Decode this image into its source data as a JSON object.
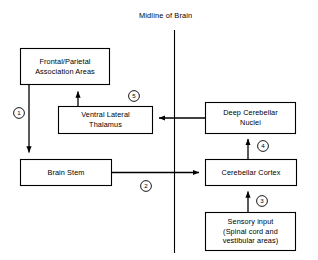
{
  "diagram": {
    "title": "Midline of Brain",
    "midline_label": "Midline of Brain",
    "nodes": [
      {
        "id": "frontal-parietal",
        "label": "Frontal/Parietal\nAssociation Areas"
      },
      {
        "id": "ventral-lateral-thalamus",
        "label": "Ventral Lateral\nThalamus"
      },
      {
        "id": "brain-stem",
        "label": "Brain Stem"
      },
      {
        "id": "deep-cerebellar-nuclei",
        "label": "Deep Cerebellar\nNuclei"
      },
      {
        "id": "cerebellar-cortex",
        "label": "Cerebellar Cortex"
      },
      {
        "id": "sensory-input",
        "label": "Sensory input\n(Spinal cord and\nvestibular areas)"
      }
    ],
    "steps": [
      {
        "id": "step-1",
        "label": "1"
      },
      {
        "id": "step-2",
        "label": "2"
      },
      {
        "id": "step-3",
        "label": "3"
      },
      {
        "id": "step-4",
        "label": "4"
      },
      {
        "id": "step-5",
        "label": "5"
      }
    ],
    "colors": {
      "stroke": "#000000",
      "background": "#ffffff",
      "text": "#000000"
    }
  }
}
